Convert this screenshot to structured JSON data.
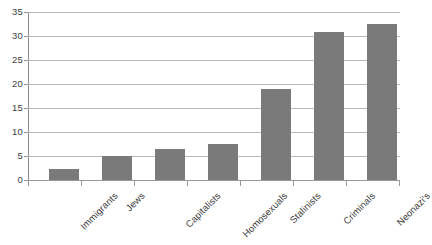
{
  "chart_data": {
    "type": "bar",
    "title": "",
    "subtitle": "",
    "xlabel": "",
    "ylabel": "",
    "categories": [
      "Immigrants",
      "Jews",
      "Capitalists",
      "Homosexuals",
      "Stalinists",
      "Criminals",
      "Neonazi's"
    ],
    "values": [
      2.2,
      4.9,
      6.4,
      7.5,
      19.0,
      30.9,
      32.4
    ],
    "series": [
      {
        "name": "",
        "values": [
          2.2,
          4.9,
          6.4,
          7.5,
          19.0,
          30.9,
          32.4
        ]
      }
    ],
    "ylim": [
      0,
      35
    ],
    "ytick_values": [
      0,
      5,
      10,
      15,
      20,
      25,
      30,
      35
    ],
    "ytick_labels": [
      "0",
      "5",
      "10",
      "15",
      "20",
      "25",
      "30",
      "35"
    ],
    "grid": "horizontal",
    "legend": "none",
    "bar_color": "#7a7a7a",
    "gridline_color": "#b9b9b9",
    "axis_color": "#8e8e8e",
    "background_color": "#ffffff",
    "xtick_label_rotation": -45
  }
}
